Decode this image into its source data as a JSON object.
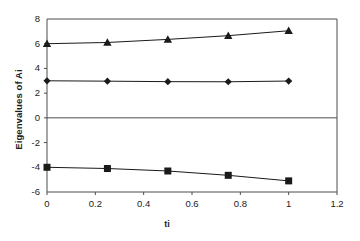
{
  "chart_data": {
    "type": "line",
    "title": "",
    "xlabel": "ti",
    "ylabel": "Eigenvalues of Ai",
    "xlim": [
      0,
      1.2
    ],
    "ylim": [
      -6,
      8
    ],
    "x": [
      0,
      0.25,
      0.5,
      0.75,
      1
    ],
    "xticks": [
      "0",
      "0.2",
      "0.4",
      "0.6",
      "0.8",
      "1",
      "1.2"
    ],
    "xtick_values": [
      0,
      0.2,
      0.4,
      0.6,
      0.8,
      1,
      1.2
    ],
    "yticks": [
      "8",
      "6",
      "4",
      "2",
      "0",
      "-2",
      "-4",
      "-6"
    ],
    "ytick_values": [
      8,
      6,
      4,
      2,
      0,
      -2,
      -4,
      -6
    ],
    "grid": "horizontal gridlines at y=8 and y=0 only",
    "legend": "none",
    "series": [
      {
        "name": "eigenvalue-1",
        "marker": "triangle",
        "color": "#1a1a1a",
        "values": [
          6.0,
          6.1,
          6.35,
          6.65,
          7.05
        ]
      },
      {
        "name": "eigenvalue-2",
        "marker": "diamond",
        "color": "#1a1a1a",
        "values": [
          3.0,
          2.97,
          2.93,
          2.92,
          2.98
        ]
      },
      {
        "name": "eigenvalue-3",
        "marker": "square",
        "color": "#1a1a1a",
        "values": [
          -4.0,
          -4.1,
          -4.3,
          -4.65,
          -5.1
        ]
      }
    ]
  },
  "axis": {
    "ylabel_text": "Eigenvalues of Ai",
    "xlabel_text": "ti",
    "ytick_0": "8",
    "ytick_1": "6",
    "ytick_2": "4",
    "ytick_3": "2",
    "ytick_4": "0",
    "ytick_5": "-2",
    "ytick_6": "-4",
    "ytick_7": "-6",
    "xtick_0": "0",
    "xtick_1": "0.2",
    "xtick_2": "0.4",
    "xtick_3": "0.6",
    "xtick_4": "0.8",
    "xtick_5": "1",
    "xtick_6": "1.2"
  }
}
